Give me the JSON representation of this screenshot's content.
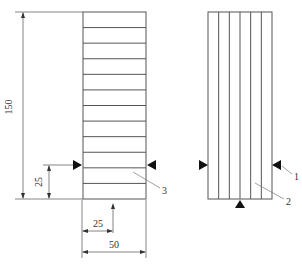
{
  "figure": {
    "left_specimen": {
      "layer_count": 12,
      "label": "3"
    },
    "right_specimen": {
      "layer_count": 6,
      "labels": [
        "1",
        "2"
      ]
    },
    "dimensions": {
      "height": "150",
      "load_height": "25",
      "load_offset": "25",
      "width": "50"
    },
    "colors": {
      "line": "#555555",
      "arrow": "#111111"
    }
  }
}
